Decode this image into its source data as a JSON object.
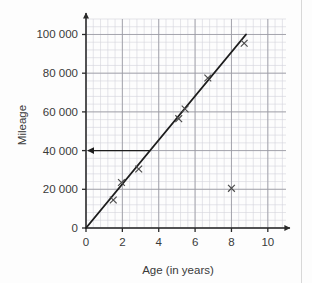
{
  "chart_data": {
    "type": "scatter",
    "title": "",
    "xlabel": "Age (in years)",
    "ylabel": "Mileage",
    "xlim": [
      0,
      11
    ],
    "ylim": [
      0,
      108000
    ],
    "grid": true,
    "grid_minor_step_x": 0.4,
    "grid_minor_step_y": 4000,
    "grid_major_step_x": 2,
    "grid_major_step_y": 20000,
    "legend": "none",
    "x_ticks": [
      0,
      2,
      4,
      6,
      8,
      10
    ],
    "x_tick_labels": [
      "0",
      "2",
      "4",
      "6",
      "8",
      "10"
    ],
    "y_ticks": [
      0,
      20000,
      40000,
      60000,
      80000,
      100000
    ],
    "y_tick_labels": [
      "0",
      "20 000",
      "40 000",
      "60 000",
      "80 000",
      "100 000"
    ],
    "points": [
      {
        "x": 1.5,
        "y": 14500
      },
      {
        "x": 1.95,
        "y": 23500
      },
      {
        "x": 2.9,
        "y": 30500
      },
      {
        "x": 5.1,
        "y": 56500
      },
      {
        "x": 5.45,
        "y": 61500
      },
      {
        "x": 6.7,
        "y": 77500
      },
      {
        "x": 8.0,
        "y": 20500
      },
      {
        "x": 8.7,
        "y": 95500
      }
    ],
    "trend_line": {
      "label": "line of best fit",
      "x_start": 0,
      "y_start": 0,
      "x_end": 8.8,
      "y_end": 100000
    },
    "annotations": [
      {
        "name": "read-off-arrow",
        "type": "arrow",
        "direction": "left",
        "y_value": 40000,
        "x_from": 3.55,
        "x_to": 0
      }
    ],
    "colors": {
      "marker": "#4a4a4a",
      "trend": "#1d1d1d",
      "axis": "#2a2a2a",
      "grid_major": "#9a9aa2",
      "grid_minor": "#d4d4dc",
      "text": "#3a3a3a",
      "background": "#fdfdfd"
    }
  },
  "axes": {
    "y_title": "Mileage",
    "x_title": "Age (in years)"
  }
}
